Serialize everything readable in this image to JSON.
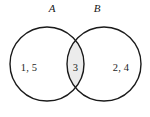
{
  "figure": {
    "type": "venn-diagram-two-set",
    "background_color": "#ffffff",
    "stroke_color": "#1a1a1a",
    "intersection_fill": "#ececec",
    "text_color": "#1d1d1d"
  },
  "labels": {
    "set_a": "A",
    "set_b": "B"
  },
  "regions": {
    "a_only": "1,  5",
    "intersection": "3",
    "b_only": "2,  4"
  },
  "geometry": {
    "circle_a": {
      "cx": 47,
      "cy": 64,
      "r": 37
    },
    "circle_b": {
      "cx": 104,
      "cy": 64,
      "r": 37
    },
    "label_a": {
      "x": 52,
      "y": 12
    },
    "label_b": {
      "x": 97,
      "y": 12
    },
    "text_a_only": {
      "x": 29,
      "y": 71
    },
    "text_intersection": {
      "x": 75.5,
      "y": 71
    },
    "text_b_only": {
      "x": 121,
      "y": 71
    }
  }
}
